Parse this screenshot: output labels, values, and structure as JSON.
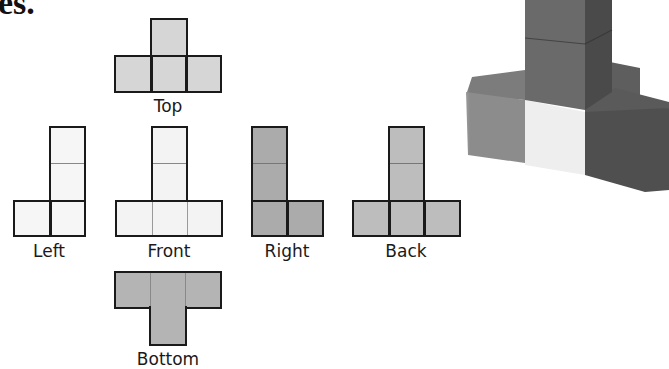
{
  "heading_fragment": "es.",
  "views": {
    "top": {
      "label": "Top",
      "fill": "#d6d6d6"
    },
    "left": {
      "label": "Left",
      "fill": "#f6f6f6"
    },
    "front": {
      "label": "Front",
      "fill": "#f3f3f3"
    },
    "right": {
      "label": "Right",
      "fill": "#ababab"
    },
    "back": {
      "label": "Back",
      "fill": "#bdbdbd"
    },
    "bottom": {
      "label": "Bottom",
      "fill": "#b4b4b4"
    }
  },
  "photo": {
    "description": "3D stack of cubes: a two-cube tower on top of a row of three cubes with one cube behind",
    "colors": {
      "tower_front": "#6e6e6e",
      "tower_side": "#4e4e4e",
      "left_block": "#8a8a8a",
      "center_block": "#eeeeee",
      "right_block": "#555555",
      "back_block": "#606060"
    }
  }
}
